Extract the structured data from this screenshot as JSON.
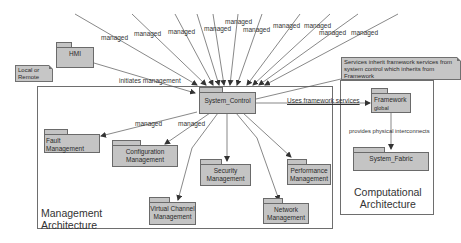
{
  "diagram": {
    "type": "uml-package-diagram",
    "frames": {
      "management": {
        "title_line1": "Management",
        "title_line2": "Architecture"
      },
      "computational": {
        "title_line1": "Computational",
        "title_line2": "Architecture"
      }
    },
    "packages": {
      "hmi": {
        "label": "HMI"
      },
      "system_control": {
        "label": "System_Control"
      },
      "framework": {
        "label": "Framework",
        "sublabel": "global"
      },
      "system_fabric": {
        "label": "System_Fabric"
      },
      "fault": {
        "label": "Fault Management"
      },
      "configuration": {
        "label_line1": "Configuration",
        "label_line2": "Management"
      },
      "security": {
        "label_line1": "Security",
        "label_line2": "Management"
      },
      "performance": {
        "label_line1": "Performance",
        "label_line2": "Management"
      },
      "virtual_channel": {
        "label_line1": "Virtual Channel",
        "label_line2": "Management"
      },
      "network": {
        "label_line1": "Network",
        "label_line2": "Management"
      }
    },
    "notes": {
      "local_remote": {
        "line1": "Local or",
        "line2": "Remote"
      },
      "framework_services": {
        "line1": "Services inherit framework services from",
        "line2": "system control which inherits from",
        "line3": "Framework"
      }
    },
    "edge_labels": {
      "managed": "managed",
      "initiates_management": "initiates management",
      "uses_framework_services": "Uses framework services",
      "provides_physical_interconnects": "provides physical interconnects"
    },
    "colors": {
      "package_fill": "#c4c4c4",
      "package_border": "#6a6a6a",
      "line": "#555555",
      "frame_border": "#6e6e6e"
    }
  }
}
